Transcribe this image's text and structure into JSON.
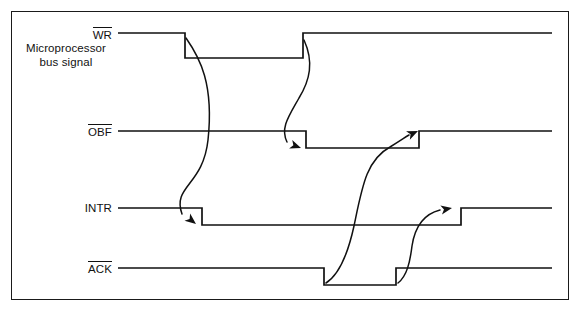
{
  "figure": {
    "type": "timing-diagram",
    "background_color": "#ffffff",
    "line_color": "#111111",
    "frame": {
      "x": 11,
      "y": 11,
      "width": 558,
      "height": 289,
      "border_width": 1.6
    }
  },
  "labels": {
    "wr": {
      "text": "WR",
      "overbar": true
    },
    "bus_note_line1": "Microprocessor",
    "bus_note_line2": "bus signal",
    "obf": {
      "text": "OBF",
      "overbar": true
    },
    "intr": {
      "text": "INTR",
      "overbar": false
    },
    "ack": {
      "text": "ACK",
      "overbar": true
    }
  },
  "chart_data": {
    "type": "line",
    "xlabel": "",
    "ylabel": "",
    "x_start": 118,
    "x_end": 552,
    "signals": [
      {
        "name": "WR",
        "overbar": true,
        "active_low": true,
        "high_y": 33,
        "low_y": 58,
        "initial_level": "high",
        "transitions": [
          {
            "x": 185,
            "edge": "falling"
          },
          {
            "x": 303,
            "edge": "rising"
          }
        ],
        "points": [
          [
            118,
            33
          ],
          [
            185,
            33
          ],
          [
            185,
            58
          ],
          [
            303,
            58
          ],
          [
            303,
            33
          ],
          [
            552,
            33
          ]
        ]
      },
      {
        "name": "OBF",
        "overbar": true,
        "active_low": true,
        "high_y": 131,
        "low_y": 148,
        "initial_level": "high",
        "transitions": [
          {
            "x": 306,
            "edge": "falling"
          },
          {
            "x": 419,
            "edge": "rising"
          }
        ],
        "points": [
          [
            118,
            131
          ],
          [
            306,
            131
          ],
          [
            306,
            148
          ],
          [
            419,
            148
          ],
          [
            419,
            131
          ],
          [
            552,
            131
          ]
        ]
      },
      {
        "name": "INTR",
        "overbar": false,
        "active_low": false,
        "high_y": 208,
        "low_y": 225,
        "initial_level": "high",
        "transitions": [
          {
            "x": 202,
            "edge": "falling"
          },
          {
            "x": 461,
            "edge": "rising"
          }
        ],
        "points": [
          [
            118,
            208
          ],
          [
            202,
            208
          ],
          [
            202,
            225
          ],
          [
            461,
            225
          ],
          [
            461,
            208
          ],
          [
            552,
            208
          ]
        ]
      },
      {
        "name": "ACK",
        "overbar": true,
        "active_low": true,
        "high_y": 268,
        "low_y": 285,
        "initial_level": "high",
        "transitions": [
          {
            "x": 324,
            "edge": "falling"
          },
          {
            "x": 396,
            "edge": "rising"
          }
        ],
        "points": [
          [
            118,
            268
          ],
          [
            324,
            268
          ],
          [
            324,
            285
          ],
          [
            396,
            285
          ],
          [
            396,
            268
          ],
          [
            552,
            268
          ]
        ]
      }
    ],
    "causal_arrows": [
      {
        "id": "wr-fall-to-intr-fall",
        "from_signal": "WR",
        "from_edge": "falling",
        "to_signal": "INTR",
        "to_edge": "falling",
        "path": "M 186,38 C 200,58 214,84 208,140 C 203,186 172,186 182,214",
        "arrow_tip": [
          196,
          224
        ],
        "arrow_angle": 38
      },
      {
        "id": "wr-rise-to-obf-fall",
        "from_signal": "WR",
        "from_edge": "rising",
        "to_signal": "OBF",
        "to_edge": "falling",
        "path": "M 304,40 C 314,62 310,80 299,98 C 289,116 280,128 287,142",
        "arrow_tip": [
          301,
          148
        ],
        "arrow_angle": 20
      },
      {
        "id": "ack-fall-to-obf-rise",
        "from_signal": "ACK",
        "from_edge": "falling",
        "to_signal": "OBF",
        "to_edge": "rising",
        "path": "M 326,283 C 337,276 347,258 354,226 C 362,188 366,160 390,147 C 400,141 404,138 409,135",
        "arrow_tip": [
          418,
          131
        ],
        "arrow_angle": -24
      },
      {
        "id": "ack-rise-to-intr-rise",
        "from_signal": "ACK",
        "from_edge": "rising",
        "to_signal": "INTR",
        "to_edge": "rising",
        "path": "M 398,283 C 407,276 410,262 412,246 C 415,226 424,214 440,210",
        "arrow_tip": [
          452,
          208
        ],
        "arrow_angle": -10
      }
    ]
  }
}
